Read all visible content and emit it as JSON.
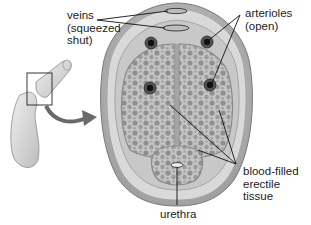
{
  "diagram": {
    "labels": {
      "veins": [
        "veins",
        "(squeezed",
        "shut)"
      ],
      "arterioles": [
        "arterioles",
        "(open)"
      ],
      "erectile_tissue": [
        "blood-filled",
        "erectile tissue"
      ],
      "urethra": [
        "urethra"
      ]
    },
    "colors": {
      "background": "#ffffff",
      "outer_sheath": "#cfcfcf",
      "tissue_fill": "#b9b9b9",
      "sinus": "#8e8e8e",
      "arteriole": "#1e1e1e",
      "arrow": "#6a6a6a",
      "leader_line": "#111111"
    }
  }
}
